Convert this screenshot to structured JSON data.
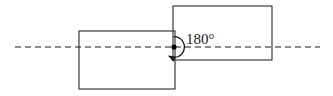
{
  "figure": {
    "background_color": "#ffffff",
    "line_color": "#2b2b2b",
    "axis_color": "#1a1a1a"
  },
  "annotation": {
    "angle_label": "180°",
    "angle_value": 180,
    "angle_unit": "degrees"
  },
  "shapes": {
    "left_rectangle": {
      "name": "pre-image-rectangle",
      "x": 79,
      "y": 31,
      "width": 96,
      "height": 58
    },
    "right_rectangle": {
      "name": "image-rectangle",
      "x": 173,
      "y": 6,
      "width": 99,
      "height": 54
    }
  },
  "axis": {
    "name": "horizontal-dashed-axis",
    "x1": 15,
    "y1": 47,
    "x2": 320,
    "y2": 47,
    "dash_pattern": "6 4"
  },
  "center_of_rotation": {
    "name": "rotation-center-point",
    "cx": 174,
    "cy": 47,
    "radius": 2.6
  },
  "rotation_symbol": {
    "name": "rotation-arc",
    "cx": 174,
    "cy": 47,
    "radius": 10,
    "direction": "counterclockwise"
  }
}
